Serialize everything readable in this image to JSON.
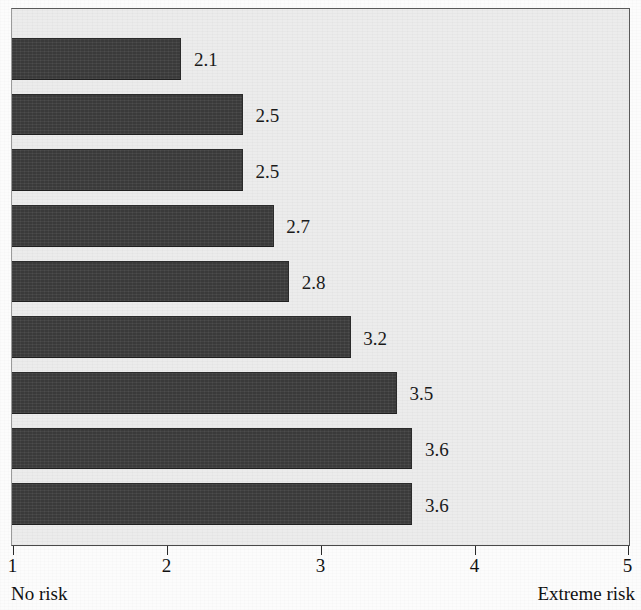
{
  "chart_data": {
    "type": "bar",
    "orientation": "horizontal",
    "title": "",
    "xlabel": "",
    "ylabel": "",
    "xlim": [
      1,
      5
    ],
    "grid": false,
    "legend": null,
    "categories": [
      "",
      "",
      "",
      "",
      "",
      "",
      "",
      "",
      ""
    ],
    "values": [
      2.1,
      2.5,
      2.5,
      2.7,
      2.8,
      3.2,
      3.5,
      3.6,
      3.6
    ],
    "value_labels": [
      "2.1",
      "2.5",
      "2.5",
      "2.7",
      "2.8",
      "3.2",
      "3.5",
      "3.6",
      "3.6"
    ],
    "x_ticks": [
      1,
      2,
      3,
      4,
      5
    ],
    "x_tick_labels": [
      "1",
      "2",
      "3",
      "4",
      "5"
    ],
    "annotations": {
      "scale_min_label": "No risk",
      "scale_max_label": "Extreme risk"
    },
    "colors": {
      "bar_fill": "#3f3f3f",
      "bar_border": "#2b2b2b",
      "plot_background": "#ececec",
      "plot_border": "#5a5a5a",
      "page_background": "#fcfcfc",
      "text": "#111111"
    }
  }
}
